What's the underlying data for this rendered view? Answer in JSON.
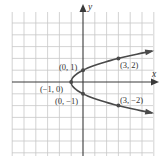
{
  "chart_data": {
    "type": "line",
    "title": "",
    "xlabel": "x",
    "ylabel": "y",
    "xlim": [
      -6,
      6
    ],
    "ylim": [
      -5,
      5
    ],
    "grid": true,
    "equation": "x = y^2 - 1",
    "series": [
      {
        "name": "parabola",
        "points": [
          {
            "x": -1,
            "y": 0
          },
          {
            "x": 0,
            "y": 1
          },
          {
            "x": 0,
            "y": -1
          },
          {
            "x": 3,
            "y": 2
          },
          {
            "x": 3,
            "y": -2
          }
        ]
      }
    ],
    "annotations": [
      {
        "text": "(0, 1)",
        "x": 0,
        "y": 1
      },
      {
        "text": "(3, 2)",
        "x": 3,
        "y": 2
      },
      {
        "text": "(−1, 0)",
        "x": -1,
        "y": 0
      },
      {
        "text": "(0, −1)",
        "x": 0,
        "y": -1
      },
      {
        "text": "(3, −2)",
        "x": 3,
        "y": -2
      }
    ],
    "colors": {
      "grid": "#c8c8c8",
      "axis": "#3a3a3a",
      "curve": "#4a4a4a"
    }
  }
}
